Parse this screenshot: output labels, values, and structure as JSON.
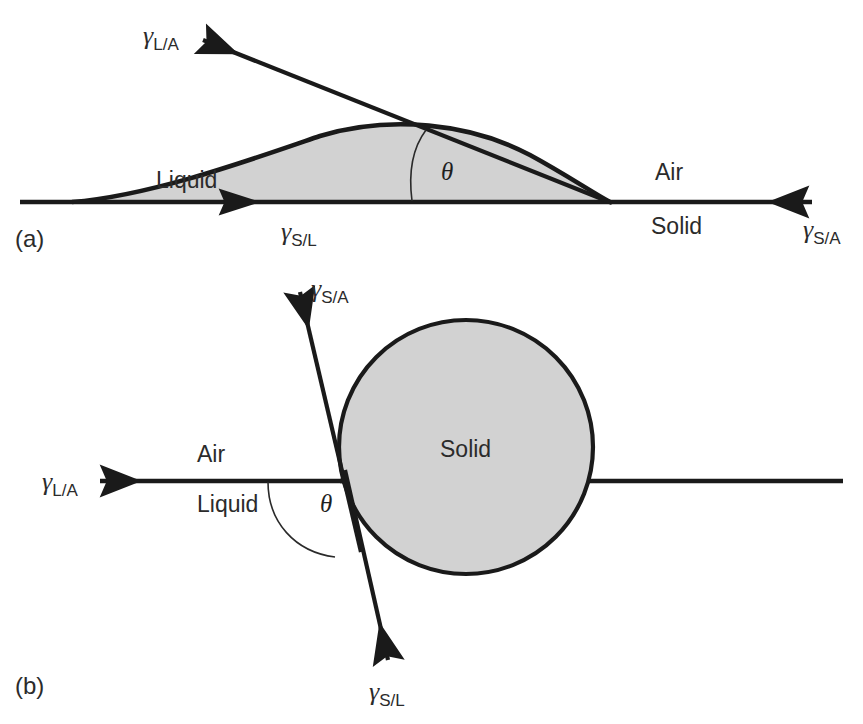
{
  "figure": {
    "background_color": "#ffffff",
    "line_color": "#1a1a1a",
    "shade_color": "#d2d2d2",
    "panels": [
      {
        "id": "a",
        "panel_label": "(a)",
        "description": "Liquid drop spreading on a flat solid surface with contact angle theta",
        "region_labels": [
          {
            "name": "liquid",
            "text": "Liquid"
          },
          {
            "name": "air",
            "text": "Air"
          },
          {
            "name": "solid",
            "text": "Solid"
          }
        ],
        "angle_symbol": "θ",
        "vectors": [
          {
            "name": "gamma-la",
            "symbol": "γ",
            "subscript": "L/A",
            "direction": "up-left"
          },
          {
            "name": "gamma-sl",
            "symbol": "γ",
            "subscript": "S/L",
            "direction": "left"
          },
          {
            "name": "gamma-sa",
            "symbol": "γ",
            "subscript": "S/A",
            "direction": "right"
          }
        ]
      },
      {
        "id": "b",
        "panel_label": "(b)",
        "description": "Spherical solid particle at a liquid-air interface with contact angle theta",
        "region_labels": [
          {
            "name": "air",
            "text": "Air"
          },
          {
            "name": "liquid",
            "text": "Liquid"
          },
          {
            "name": "solid",
            "text": "Solid"
          }
        ],
        "angle_symbol": "θ",
        "vectors": [
          {
            "name": "gamma-sa",
            "symbol": "γ",
            "subscript": "S/A",
            "direction": "up-right"
          },
          {
            "name": "gamma-la",
            "symbol": "γ",
            "subscript": "L/A",
            "direction": "left"
          },
          {
            "name": "gamma-sl",
            "symbol": "γ",
            "subscript": "S/L",
            "direction": "down-right"
          }
        ]
      }
    ]
  },
  "a": {
    "panel_label": "(a)",
    "liquid": "Liquid",
    "air": "Air",
    "solid": "Solid",
    "theta": "θ",
    "g_la": "γ",
    "g_la_sub": "L/A",
    "g_sl": "γ",
    "g_sl_sub": "S/L",
    "g_sa": "γ",
    "g_sa_sub": "S/A"
  },
  "b": {
    "panel_label": "(b)",
    "air": "Air",
    "liquid": "Liquid",
    "solid": "Solid",
    "theta": "θ",
    "g_sa": "γ",
    "g_sa_sub": "S/A",
    "g_la": "γ",
    "g_la_sub": "L/A",
    "g_sl": "γ",
    "g_sl_sub": "S/L"
  }
}
